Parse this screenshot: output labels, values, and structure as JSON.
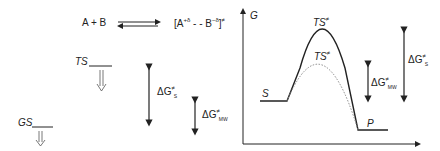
{
  "equation": {
    "reactants": "A + B",
    "ts_bracket_open": "[A",
    "a_charge": "+δ",
    "dots": " - - B",
    "b_charge": "−δ",
    "ts_bracket_close": "]",
    "ts_symbol": "≠"
  },
  "left_panel": {
    "ts_label": "TS",
    "gs_label": "GS",
    "dg_s": {
      "delta": "ΔG",
      "sup": "≠",
      "sub": "S"
    },
    "dg_mw": {
      "delta": "ΔG",
      "sup": "≠",
      "sub": "MW"
    }
  },
  "energy_plot": {
    "y_axis_label": "G",
    "ts_upper": {
      "label": "TS",
      "sup": "≠"
    },
    "ts_lower": {
      "label": "TS",
      "sup": "≠"
    },
    "start_label": "S",
    "product_label": "P",
    "dg_mw": {
      "delta": "ΔG",
      "sup": "≠",
      "sub": "MW"
    },
    "dg_s": {
      "delta": "ΔG",
      "sup": "≠",
      "sub": "S"
    },
    "colors": {
      "line": "#222222",
      "dotted": "#888888"
    }
  }
}
